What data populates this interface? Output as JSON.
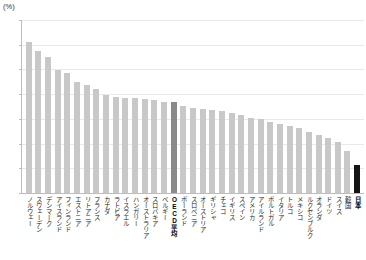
{
  "chart_data": {
    "type": "bar",
    "title": "",
    "xlabel": "",
    "ylabel": "",
    "unit_label": "(%)",
    "ylim": [
      0,
      35
    ],
    "yticks": [
      0,
      5,
      10,
      15,
      20,
      25,
      30,
      35
    ],
    "ytick_labels": [
      "0",
      "5",
      "10",
      "15",
      "20",
      "25",
      "30",
      "35"
    ],
    "grid": true,
    "legend": "none",
    "categories": [
      "ノルウェー",
      "スウェーデン",
      "デンマーク",
      "アイスランド",
      "フィンランド",
      "エストニア",
      "リトアニア",
      "フランス",
      "カナダ",
      "ラトビア",
      "イスラエル",
      "ハンガリー",
      "オーストラリア",
      "スロバキア",
      "ベルギー",
      "OECD平均",
      "ポーランド",
      "スロベニア",
      "オーストリア",
      "ギリシャ",
      "チェコ",
      "イギリス",
      "スペイン",
      "アメリカ",
      "アイルランド",
      "ポルトガル",
      "イタリア",
      "トルコ",
      "メキシコ",
      "ルクセンブルク",
      "オランダ",
      "ドイツ",
      "スイス",
      "韓国",
      "日本"
    ],
    "values": [
      30.6,
      28.7,
      27.6,
      24.9,
      24.2,
      22.4,
      21.8,
      21.1,
      19.8,
      19.4,
      19.3,
      19.2,
      19.1,
      18.9,
      18.5,
      18.4,
      17.6,
      17.3,
      16.9,
      16.7,
      16.5,
      16.2,
      15.8,
      15.2,
      14.9,
      14.4,
      14.0,
      13.5,
      13.1,
      12.4,
      11.8,
      11.2,
      10.4,
      8.4,
      5.7
    ],
    "highlights": {
      "OECD平均": "average",
      "日本": "focus"
    }
  },
  "colors": {
    "bar_default": "#c8c8c8",
    "bar_average": "#8a8a8a",
    "bar_focus": "#141414",
    "gridline": "#e9e9e9",
    "axis": "#bdbdbd",
    "text": "#262626",
    "background": "#ffffff"
  }
}
